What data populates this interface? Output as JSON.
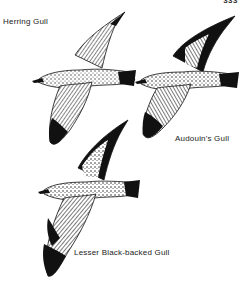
{
  "page": {
    "number": "333"
  },
  "figures": [
    {
      "id": "herring-gull",
      "label": "Herring Gull"
    },
    {
      "id": "audouins-gull",
      "label": "Audouin's Gull"
    },
    {
      "id": "lesser-black-backed-gull",
      "label": "Lesser Black-backed Gull"
    }
  ],
  "colors": {
    "ink": "#111111",
    "paper": "#ffffff",
    "mid": "#888888"
  }
}
